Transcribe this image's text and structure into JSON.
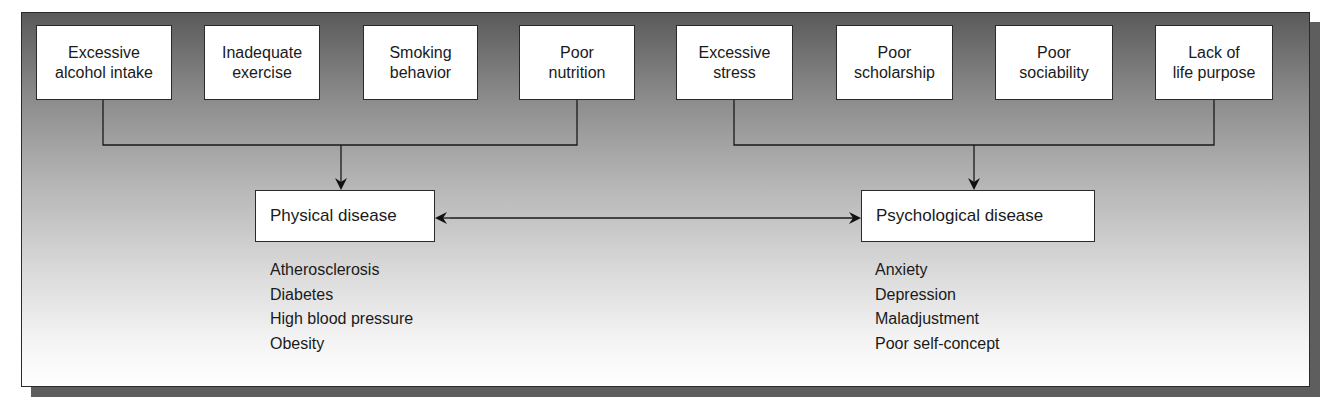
{
  "diagram": {
    "lifestyle_factors": [
      {
        "label": "Excessive\nalcohol intake"
      },
      {
        "label": "Inadequate\nexercise"
      },
      {
        "label": "Smoking\nbehavior"
      },
      {
        "label": "Poor\nnutrition"
      }
    ],
    "psychosocial_factors": [
      {
        "label": "Excessive\nstress"
      },
      {
        "label": "Poor\nscholarship"
      },
      {
        "label": "Poor\nsociability"
      },
      {
        "label": "Lack of\nlife purpose"
      }
    ],
    "physical": {
      "title": "Physical disease",
      "examples": [
        "Atherosclerosis",
        "Diabetes",
        "High blood pressure",
        "Obesity"
      ]
    },
    "psychological": {
      "title": "Psychological disease",
      "examples": [
        "Anxiety",
        "Depression",
        "Maladjustment",
        "Poor self-concept"
      ]
    },
    "connector": "bidirectional arrow between Physical disease and Psychological disease"
  }
}
